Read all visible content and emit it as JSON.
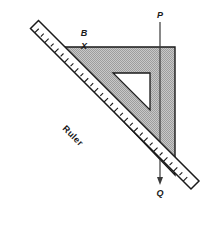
{
  "figure": {
    "background_color": "#ffffff",
    "stroke_color": "#1a1a1a",
    "shade_color": "#b9b9b9",
    "ruler_fill": "#ffffff"
  },
  "labels": {
    "point_p": "P",
    "point_q": "Q",
    "point_b": "B",
    "mark_b": "X",
    "ruler": "Ruler"
  },
  "set_square": {
    "name": "shaded-right-triangle",
    "fill": "#b9b9b9",
    "vertices": [
      {
        "x": 52,
        "y": 47
      },
      {
        "x": 175,
        "y": 47
      },
      {
        "x": 175,
        "y": 175
      }
    ],
    "inner_cutout": {
      "name": "triangular-cutout",
      "fill": "#ffffff",
      "vertices": [
        {
          "x": 113,
          "y": 73
        },
        {
          "x": 150,
          "y": 73
        },
        {
          "x": 150,
          "y": 110
        }
      ]
    }
  },
  "ruler": {
    "name": "ruler-straightedge",
    "angle_deg": 45,
    "tick_count": 23,
    "tick_long_px": 7,
    "tick_short_px": 4,
    "edge_start": {
      "x": 22,
      "y": 40
    },
    "edge_end": {
      "x": 190,
      "y": 208
    }
  },
  "line_pq": {
    "name": "vertical-line-p-q",
    "top": {
      "x": 160,
      "y": 22
    },
    "bottom": {
      "x": 160,
      "y": 183
    },
    "arrow_at": "Q"
  }
}
